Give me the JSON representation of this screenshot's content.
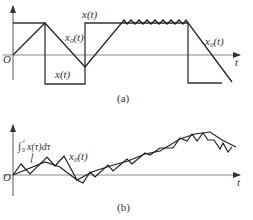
{
  "figure": {
    "panel_a": {
      "caption": "(a)",
      "origin_label": "O",
      "t_axis_label": "t",
      "x_label_top": "x(t)",
      "x_label_bottom": "x(t)",
      "x0_label_left": "x",
      "x0_label_right": "x",
      "x0_sub": "0",
      "x0_suffix": "(t)"
    },
    "panel_b": {
      "caption": "(b)",
      "origin_label": "O",
      "t_axis_label": "t",
      "integral_label": "∫",
      "integral_upper": "t",
      "integral_lower": "0",
      "integral_body": "x(τ)dτ",
      "x0_label": "x",
      "x0_sub": "0",
      "x0_suffix": "(t)"
    },
    "colors": {
      "curve": "#222222",
      "axis": "#666666"
    }
  }
}
